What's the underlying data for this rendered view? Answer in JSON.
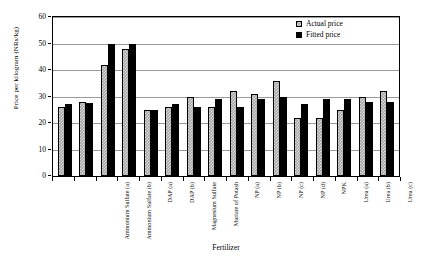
{
  "chart_data": {
    "type": "bar",
    "title": "",
    "xlabel": "Fertilizer",
    "ylabel": "Price per kilogram (NRs/kg)",
    "ylim": [
      0,
      60
    ],
    "yticks": [
      0,
      10,
      20,
      30,
      40,
      50,
      60
    ],
    "grid": true,
    "legend_position": "top-right",
    "categories": [
      "Ammonium Sulfate (a)",
      "Ammonium Sulfate (b)",
      "DAP (a)",
      "DAP (b)",
      "Magnesium Sulfate",
      "Muriate of Potash",
      "NP (a)",
      "NP (b)",
      "NP (c)",
      "NP (d)",
      "NPK",
      "Urea (a)",
      "Urea (b)",
      "Urea (c)",
      "Urea (d)",
      "Urea (e)"
    ],
    "series": [
      {
        "name": "Actual price",
        "color": "#a8a8a8",
        "values": [
          26,
          28,
          42,
          48,
          25,
          26,
          30,
          26,
          32,
          31,
          36,
          22,
          22,
          25,
          30,
          32
        ]
      },
      {
        "name": "Fitted price",
        "color": "#000000",
        "values": [
          27,
          27.5,
          50,
          50,
          25,
          27,
          26,
          29,
          26,
          29,
          30,
          27,
          29,
          29,
          28,
          28
        ]
      }
    ]
  },
  "legend": {
    "items": [
      {
        "label": "Actual price",
        "swatch": "actual-price-swatch"
      },
      {
        "label": "Fitted price",
        "swatch": "fitted-price-swatch"
      }
    ]
  }
}
